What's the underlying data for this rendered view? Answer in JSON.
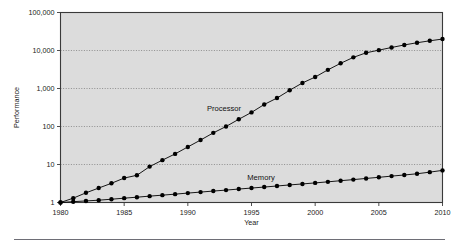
{
  "chart_data": {
    "type": "line",
    "title": "",
    "subtitle": "",
    "xlabel": "Year",
    "ylabel": "Performance",
    "xlim": [
      1980,
      2010
    ],
    "ylim": [
      1,
      100000
    ],
    "yscale": "log",
    "xscale": "linear",
    "grid": true,
    "grid_axis": "y",
    "legend": "inline-annotations",
    "xticks": [
      1980,
      1985,
      1990,
      1995,
      2000,
      2005,
      2010
    ],
    "xtick_labels": [
      "1980",
      "1985",
      "1990",
      "1995",
      "2000",
      "2005",
      "2010"
    ],
    "yticks": [
      1,
      10,
      100,
      1000,
      10000,
      100000
    ],
    "ytick_labels": [
      "1",
      "10",
      "100",
      "1,000",
      "10,000",
      "100,000"
    ],
    "annotations": [
      {
        "text": "Processor",
        "x": 1992.0,
        "y": 280
      },
      {
        "text": "Memory",
        "x": 1995.5,
        "y": 4.6
      }
    ],
    "series": [
      {
        "name": "Processor",
        "marker": "filled-circle",
        "x": [
          1980,
          1981,
          1982,
          1983,
          1984,
          1985,
          1986,
          1987,
          1988,
          1989,
          1990,
          1991,
          1992,
          1993,
          1994,
          1995,
          1996,
          1997,
          1998,
          1999,
          2000,
          2001,
          2002,
          2003,
          2004,
          2005,
          2006,
          2007,
          2008,
          2009,
          2010
        ],
        "values": [
          1,
          1.3,
          1.8,
          2.4,
          3.2,
          4.4,
          5.2,
          8.8,
          13,
          19,
          29,
          44,
          68,
          100,
          155,
          235,
          380,
          560,
          900,
          1400,
          2000,
          3100,
          4600,
          6600,
          8700,
          10200,
          12000,
          14000,
          16000,
          18000,
          20000
        ]
      },
      {
        "name": "Memory",
        "marker": "filled-circle",
        "x": [
          1980,
          1981,
          1982,
          1983,
          1984,
          1985,
          1986,
          1987,
          1988,
          1989,
          1990,
          1991,
          1992,
          1993,
          1994,
          1995,
          1996,
          1997,
          1998,
          1999,
          2000,
          2001,
          2002,
          2003,
          2004,
          2005,
          2006,
          2007,
          2008,
          2009,
          2010
        ],
        "values": [
          1,
          1.05,
          1.1,
          1.15,
          1.22,
          1.3,
          1.38,
          1.47,
          1.56,
          1.66,
          1.77,
          1.88,
          2.0,
          2.12,
          2.26,
          2.4,
          2.55,
          2.72,
          2.9,
          3.08,
          3.28,
          3.5,
          3.75,
          4.0,
          4.3,
          4.6,
          4.95,
          5.3,
          5.7,
          6.3,
          7.0
        ]
      }
    ]
  },
  "axes": {
    "y_axis_title": "Performance",
    "x_axis_title": "Year"
  },
  "labels": {
    "processor": "Processor",
    "memory": "Memory"
  },
  "colors": {
    "plot_background": "#dcdcdc",
    "page_background": "#ffffff",
    "line": "#000000",
    "grid": "#6e6e6e",
    "frame": "#3a3a3a",
    "text": "#1a1a1a",
    "footer_rule": "#5d5d66"
  }
}
